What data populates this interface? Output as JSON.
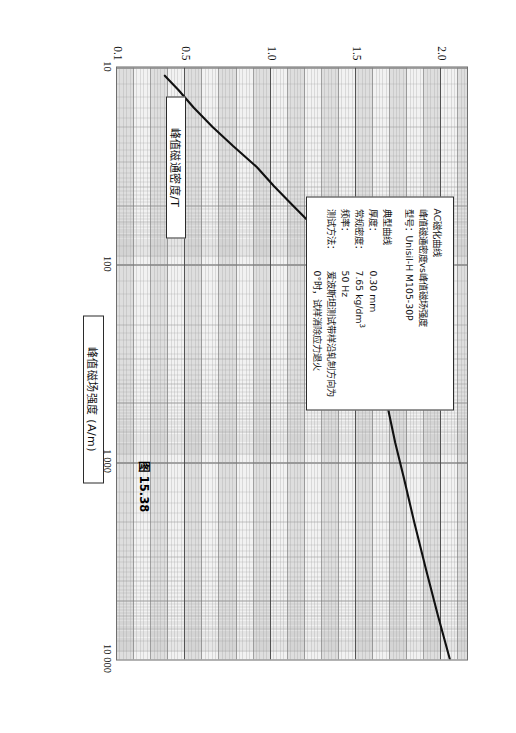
{
  "figure": {
    "caption": "图 15.38",
    "orientation_deg": 90
  },
  "info_box": {
    "title_line1": "AC磁化曲线",
    "title_line2": "峰值磁通密度vs峰值磁场强度",
    "model_label": "型号：",
    "model_value": "Unisil-H M105-30P",
    "subtitle": "典型曲线",
    "rows": [
      {
        "key": "厚度：",
        "value": "0.30 mm"
      },
      {
        "key": "常规密度：",
        "value": "7.65 kg/dm",
        "sup": "3"
      },
      {
        "key": "频率：",
        "value": "50 Hz"
      },
      {
        "key": "测试方法：",
        "value": "爱波斯坦测试带样沿轧制方向为0°时，试样消除应力退火"
      }
    ]
  },
  "chart_data": {
    "type": "line",
    "title": "AC磁化曲线 峰值磁通密度vs峰值磁场强度",
    "xlabel": "峰值磁场强度 (A/m)",
    "ylabel": "峰值磁通密度/T",
    "xscale": "log",
    "yscale": "linear",
    "xlim": [
      10,
      10000
    ],
    "ylim": [
      0.1,
      2.15
    ],
    "grid": true,
    "legend": "none",
    "xticks": [
      {
        "value": 10,
        "label": "10"
      },
      {
        "value": 100,
        "label": "100"
      },
      {
        "value": 1000,
        "label": "1 000"
      },
      {
        "value": 10000,
        "label": "10 000"
      }
    ],
    "yticks": [
      {
        "value": 0.1,
        "label": "0.1"
      },
      {
        "value": 0.5,
        "label": "0.5"
      },
      {
        "value": 1.0,
        "label": "1.0"
      },
      {
        "value": 1.5,
        "label": "1.5"
      },
      {
        "value": 2.0,
        "label": "2.0"
      }
    ],
    "series": [
      {
        "name": "Unisil-H M105-30P AC magnetization",
        "x": [
          11,
          13,
          16,
          20,
          25,
          32,
          40,
          50,
          60,
          70,
          80,
          90,
          100,
          120,
          150,
          200,
          300,
          500,
          800,
          1200,
          2000,
          3500,
          6000,
          10000
        ],
        "y": [
          0.38,
          0.46,
          0.55,
          0.66,
          0.78,
          0.92,
          1.02,
          1.13,
          1.22,
          1.29,
          1.34,
          1.38,
          1.41,
          1.46,
          1.51,
          1.56,
          1.62,
          1.68,
          1.73,
          1.78,
          1.84,
          1.91,
          1.98,
          2.05
        ]
      }
    ]
  }
}
